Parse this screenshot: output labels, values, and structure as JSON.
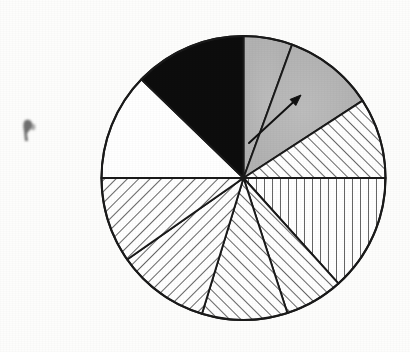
{
  "figure": {
    "name": "pie-chart-diagram",
    "background_color": "#fdfdfc",
    "outline_color": "#1a1a1a",
    "center_x": 243.5,
    "center_y": 178,
    "radius": 142,
    "caption": "",
    "title": "",
    "has_labels": false,
    "has_legend": false,
    "has_axes": false
  },
  "annotations": [
    {
      "name": "pointer-arrow",
      "type": "arrow",
      "description": "thin arrow pointing up-right from near the pie centre into the light-grey sector",
      "tail_x": 249,
      "tail_y": 143,
      "tip_x": 301,
      "tip_y": 95,
      "color": "#111111"
    },
    {
      "name": "scan-smudge",
      "type": "artifact",
      "description": "small dark ink smudge on the page at the left margin",
      "x": 28,
      "y": 129,
      "color": "#4a4a4a"
    }
  ],
  "chart_data": {
    "type": "pie",
    "title": "",
    "xlabel": "",
    "ylabel": "",
    "legend_position": "none",
    "grid": false,
    "total_degrees": 360,
    "units": "degrees",
    "start_angle_deg": 90,
    "direction": "clockwise",
    "categories": [
      "sector-1-grey",
      "sector-2-grey-arrow",
      "sector-3-hatch-diagonal-right",
      "sector-4-hatch-vertical",
      "sector-5-hatch-diagonal-right",
      "sector-6-hatch-diagonal-right",
      "sector-7-hatch-diagonal-left",
      "sector-8-hatch-diagonal-left",
      "sector-9-white",
      "sector-10-black"
    ],
    "values": [
      20,
      37,
      33,
      48,
      24,
      35,
      38,
      35,
      44,
      46
    ],
    "percentages": [
      5.6,
      10.3,
      9.2,
      13.3,
      6.7,
      9.7,
      10.6,
      9.7,
      12.2,
      12.8
    ],
    "slices": [
      {
        "name": "sector-1-grey",
        "start_deg": 90,
        "end_deg": 70,
        "sweep_deg": 20,
        "fill": "solid-grey",
        "color": "#b9b9b9",
        "label": ""
      },
      {
        "name": "sector-2-grey-arrow",
        "start_deg": 70,
        "end_deg": 33,
        "sweep_deg": 37,
        "fill": "solid-grey",
        "color": "#b9b9b9",
        "label": ""
      },
      {
        "name": "sector-3-hatch-diagonal-right",
        "start_deg": 33,
        "end_deg": 0,
        "sweep_deg": 33,
        "fill": "hatch-diagonal-up-right",
        "color": "#ffffff",
        "label": ""
      },
      {
        "name": "sector-4-hatch-vertical",
        "start_deg": 0,
        "end_deg": -48,
        "sweep_deg": 48,
        "fill": "hatch-vertical",
        "color": "#ffffff",
        "label": ""
      },
      {
        "name": "sector-5-hatch-diagonal-right",
        "start_deg": -48,
        "end_deg": -72,
        "sweep_deg": 24,
        "fill": "hatch-diagonal-up-right",
        "color": "#ffffff",
        "label": ""
      },
      {
        "name": "sector-6-hatch-diagonal-right",
        "start_deg": -72,
        "end_deg": -107,
        "sweep_deg": 35,
        "fill": "hatch-diagonal-up-right",
        "color": "#ffffff",
        "label": ""
      },
      {
        "name": "sector-7-hatch-diagonal-left",
        "start_deg": -107,
        "end_deg": -145,
        "sweep_deg": 38,
        "fill": "hatch-diagonal-down-right",
        "color": "#ffffff",
        "label": ""
      },
      {
        "name": "sector-8-hatch-diagonal-left",
        "start_deg": -145,
        "end_deg": -180,
        "sweep_deg": 35,
        "fill": "hatch-diagonal-down-right",
        "color": "#ffffff",
        "label": ""
      },
      {
        "name": "sector-9-white",
        "start_deg": 180,
        "end_deg": 136,
        "sweep_deg": 44,
        "fill": "solid-white",
        "color": "#ffffff",
        "label": ""
      },
      {
        "name": "sector-10-black",
        "start_deg": 136,
        "end_deg": 90,
        "sweep_deg": 46,
        "fill": "solid-black",
        "color": "#0d0d0d",
        "label": ""
      }
    ]
  }
}
